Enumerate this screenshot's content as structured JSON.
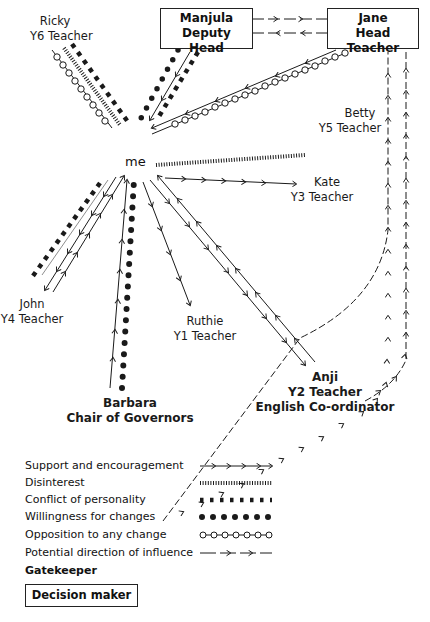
{
  "center": {
    "label": "me"
  },
  "nodes": {
    "ricky": {
      "name": "Ricky",
      "role": "Y6 Teacher"
    },
    "manjula": {
      "name": "Manjula",
      "role": "Deputy Head",
      "decision_maker": true
    },
    "jane": {
      "name": "Jane",
      "role": "Head Teacher",
      "decision_maker": true
    },
    "betty": {
      "name": "Betty",
      "role": "Y5 Teacher"
    },
    "kate": {
      "name": "Kate",
      "role": "Y3 Teacher"
    },
    "john": {
      "name": "John",
      "role": "Y4 Teacher"
    },
    "ruthie": {
      "name": "Ruthie",
      "role": "Y1 Teacher"
    },
    "barbara": {
      "name": "Barbara",
      "role": "Chair of Governors",
      "gatekeeper": true
    },
    "anji": {
      "name": "Anji",
      "role": "Y2 Teacher",
      "role2": "English Co-ordinator",
      "gatekeeper": true
    }
  },
  "legend": {
    "support": "Support and encouragement",
    "disinterest": "Disinterest",
    "conflict": "Conflict of personality",
    "willingness": "Willingness for changes",
    "opposition": "Opposition to any change",
    "influence": "Potential direction of influence",
    "gatekeeper": "Gatekeeper",
    "decision_maker": "Decision maker"
  },
  "relationships": [
    {
      "from": "ricky",
      "to": "me",
      "types": [
        "opposition",
        "disinterest",
        "conflict"
      ]
    },
    {
      "from": "manjula",
      "to": "me",
      "types": [
        "willingness",
        "support",
        "conflict"
      ]
    },
    {
      "from": "jane",
      "to": "me",
      "types": [
        "support",
        "opposition"
      ]
    },
    {
      "from": "me",
      "to": "betty",
      "types": [
        "disinterest"
      ]
    },
    {
      "from": "me",
      "to": "kate",
      "types": [
        "support"
      ]
    },
    {
      "from": "me",
      "to": "john",
      "types": [
        "conflict",
        "support-both-ways"
      ]
    },
    {
      "from": "me",
      "to": "ruthie",
      "types": [
        "support"
      ]
    },
    {
      "from": "barbara",
      "to": "me",
      "types": [
        "support",
        "willingness"
      ]
    },
    {
      "from": "me",
      "to": "anji",
      "types": [
        "support-both-ways"
      ]
    },
    {
      "from": "manjula",
      "to": "jane",
      "types": [
        "influence-both-ways"
      ]
    },
    {
      "from": "barbara",
      "to": "jane",
      "types": [
        "influence"
      ]
    },
    {
      "from": "anji",
      "to": "jane",
      "types": [
        "influence"
      ]
    }
  ],
  "colors": {
    "ink": "#1a1a1a",
    "background": "#ffffff"
  }
}
